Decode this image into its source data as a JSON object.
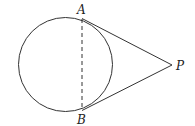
{
  "diagram": {
    "type": "geometry",
    "circle": {
      "cx": 65.5,
      "cy": 64.5,
      "r": 47
    },
    "points": {
      "A": {
        "label": "A",
        "x": 82,
        "y": 18.5
      },
      "B": {
        "label": "B",
        "x": 82,
        "y": 110.5
      },
      "P": {
        "label": "P",
        "x": 172,
        "y": 65
      }
    },
    "segments": [
      {
        "from": "A",
        "to": "P",
        "style": "solid"
      },
      {
        "from": "B",
        "to": "P",
        "style": "solid"
      },
      {
        "from": "A",
        "to": "B",
        "style": "dashed"
      }
    ],
    "stroke_color": "#333333"
  }
}
